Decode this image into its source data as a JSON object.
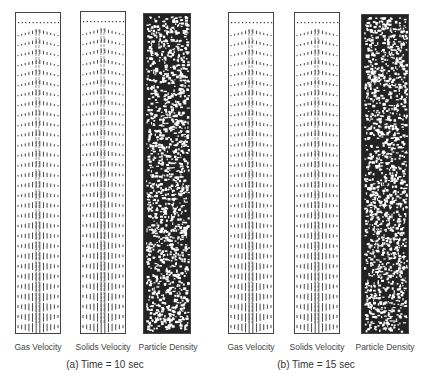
{
  "figure": {
    "groups": [
      {
        "caption": "(a) Time = 10 sec",
        "panels": [
          {
            "label": "Gas Velocity",
            "type": "vector"
          },
          {
            "label": "Solids Velocity",
            "type": "vector"
          },
          {
            "label": "Particle Density",
            "type": "density"
          }
        ]
      },
      {
        "caption": "(b) Time = 15 sec",
        "panels": [
          {
            "label": "Gas Velocity",
            "type": "vector"
          },
          {
            "label": "Solids Velocity",
            "type": "vector"
          },
          {
            "label": "Particle Density",
            "type": "density"
          }
        ]
      }
    ]
  },
  "colors": {
    "ink": "#333333",
    "border": "#444444"
  }
}
